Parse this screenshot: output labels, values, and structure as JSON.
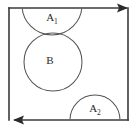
{
  "figure": {
    "background_color": "#ffffff",
    "frame": {
      "name": "square-boundary",
      "stroke_color": "#3a3a3a",
      "left": 9,
      "top": 8,
      "right": 128,
      "bottom": 120,
      "arrows": [
        {
          "name": "top-edge-arrow",
          "edge": "top",
          "direction": "right",
          "tip_x": 128,
          "tip_y": 8
        },
        {
          "name": "bottom-edge-arrow",
          "edge": "bottom",
          "direction": "left",
          "tip_x": 14,
          "tip_y": 120
        }
      ]
    },
    "regions": [
      {
        "id": "A1",
        "label": "A",
        "subscript": "1",
        "shape": "circle-clipped-by-top-edge",
        "center_x": 52,
        "center_y": 5,
        "radius": 30,
        "label_x": 52,
        "label_y": 19,
        "stroke_color": "#555555"
      },
      {
        "id": "B",
        "label": "B",
        "subscript": "",
        "shape": "circle",
        "center_x": 53,
        "center_y": 62,
        "radius": 29,
        "label_x": 50,
        "label_y": 60,
        "stroke_color": "#555555"
      },
      {
        "id": "A2",
        "label": "A",
        "subscript": "2",
        "shape": "semicircle-on-bottom-edge",
        "center_x": 95,
        "center_y": 120,
        "radius": 25,
        "label_x": 95,
        "label_y": 110,
        "stroke_color": "#555555"
      }
    ]
  }
}
